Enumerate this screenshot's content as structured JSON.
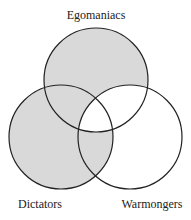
{
  "diagram": {
    "type": "venn-3",
    "colors": {
      "shade": "#d9d9d9",
      "stroke": "#222222",
      "background": "#ffffff"
    },
    "sets": [
      {
        "id": "E",
        "label": "Egomaniacs",
        "cx": 96,
        "cy": 80,
        "r": 52
      },
      {
        "id": "D",
        "label": "Dictators",
        "cx": 61,
        "cy": 137,
        "r": 52
      },
      {
        "id": "W",
        "label": "Warmongers",
        "cx": 130,
        "cy": 137,
        "r": 52
      }
    ],
    "labels": {
      "egomaniacs": "Egomaniacs",
      "dictators": "Dictators",
      "warmongers": "Warmongers"
    },
    "shaded_regions": [
      "E only",
      "E and D not W",
      "D only",
      "D and W not E"
    ],
    "unshaded_regions": [
      "E and W not D",
      "E and D and W",
      "W only"
    ]
  }
}
